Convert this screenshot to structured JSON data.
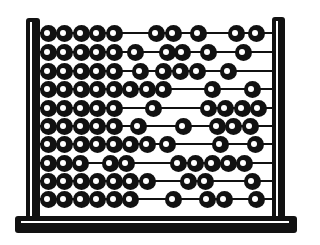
{
  "image": {
    "subject": "abacus",
    "colors": {
      "ink": "#111111",
      "background": "#ffffff"
    },
    "frame": {
      "left_post": {
        "x": 26,
        "y": 18,
        "w": 14,
        "h": 202
      },
      "right_post": {
        "x": 272,
        "y": 17,
        "w": 13,
        "h": 203
      },
      "base": {
        "x": 15,
        "y": 216,
        "w": 282,
        "h": 17
      }
    },
    "rods": [
      {
        "y": 33,
        "beads": [
          48,
          64,
          81,
          97,
          114,
          156,
          173,
          198,
          236,
          256
        ]
      },
      {
        "y": 52,
        "beads": [
          48,
          64,
          81,
          97,
          114,
          135,
          167,
          182,
          208,
          243
        ]
      },
      {
        "y": 71,
        "beads": [
          48,
          64,
          81,
          97,
          114,
          140,
          163,
          180,
          197,
          228
        ]
      },
      {
        "y": 89,
        "beads": [
          48,
          64,
          81,
          97,
          114,
          130,
          147,
          163,
          212,
          252
        ]
      },
      {
        "y": 108,
        "beads": [
          48,
          64,
          81,
          97,
          114,
          153,
          208,
          225,
          242,
          258
        ]
      },
      {
        "y": 126,
        "beads": [
          48,
          64,
          81,
          97,
          114,
          138,
          183,
          217,
          233,
          250
        ]
      },
      {
        "y": 144,
        "beads": [
          48,
          64,
          81,
          97,
          114,
          130,
          147,
          167,
          220,
          255
        ]
      },
      {
        "y": 163,
        "beads": [
          48,
          64,
          80,
          110,
          126,
          178,
          195,
          212,
          228,
          244
        ]
      },
      {
        "y": 181,
        "beads": [
          48,
          64,
          81,
          97,
          114,
          130,
          147,
          188,
          205,
          252
        ]
      },
      {
        "y": 199,
        "beads": [
          48,
          64,
          81,
          97,
          114,
          130,
          173,
          207,
          224,
          256
        ]
      }
    ]
  }
}
